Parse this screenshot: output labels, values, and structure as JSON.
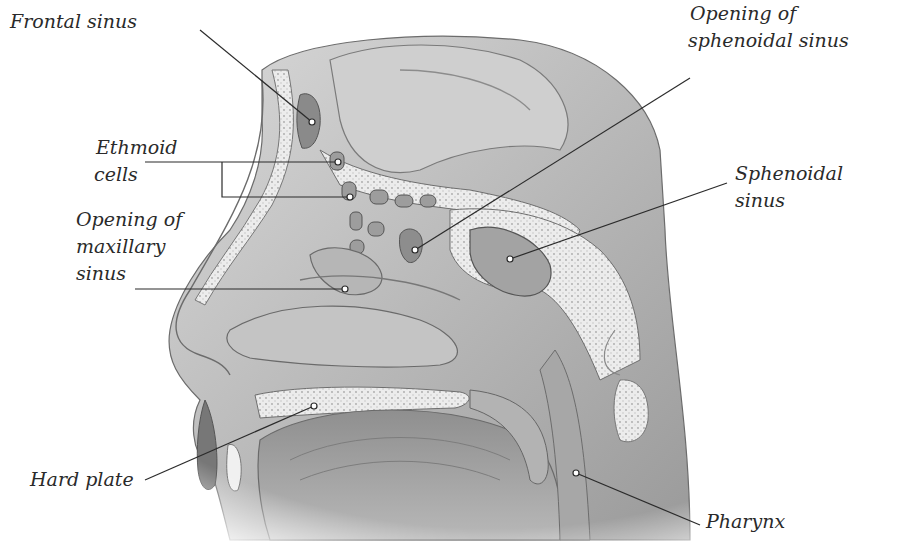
{
  "diagram": {
    "labels": [
      {
        "id": "frontal-sinus",
        "lines": [
          "Frontal sinus"
        ],
        "x": 10,
        "y": 8,
        "pointer": [
          312,
          122
        ]
      },
      {
        "id": "ethmoid-cells",
        "lines": [
          "Ethmoid",
          "cells"
        ],
        "x": 96,
        "y": 60,
        "pointer": [
          338,
          162
        ],
        "pointer2": [
          350,
          197
        ]
      },
      {
        "id": "opening-maxillary-sinus",
        "lines": [
          "Opening of",
          "maxillary",
          "sinus"
        ],
        "x": 76,
        "y": 206,
        "pointer": [
          345,
          288
        ]
      },
      {
        "id": "opening-sphenoidal-sinus",
        "lines": [
          "Opening of",
          "sphenoidal sinus"
        ],
        "x": 688,
        "y": 0,
        "pointer": [
          415,
          250
        ]
      },
      {
        "id": "sphenoidal-sinus",
        "lines": [
          "Sphenoidal",
          "sinus"
        ],
        "x": 735,
        "y": 160,
        "pointer": [
          510,
          259
        ]
      },
      {
        "id": "hard-plate",
        "lines": [
          "Hard plate"
        ],
        "x": 30,
        "y": 466,
        "pointer": [
          314,
          406
        ]
      },
      {
        "id": "pharynx",
        "lines": [
          "Pharynx"
        ],
        "x": 706,
        "y": 530,
        "pointer": [
          576,
          473
        ]
      }
    ]
  }
}
